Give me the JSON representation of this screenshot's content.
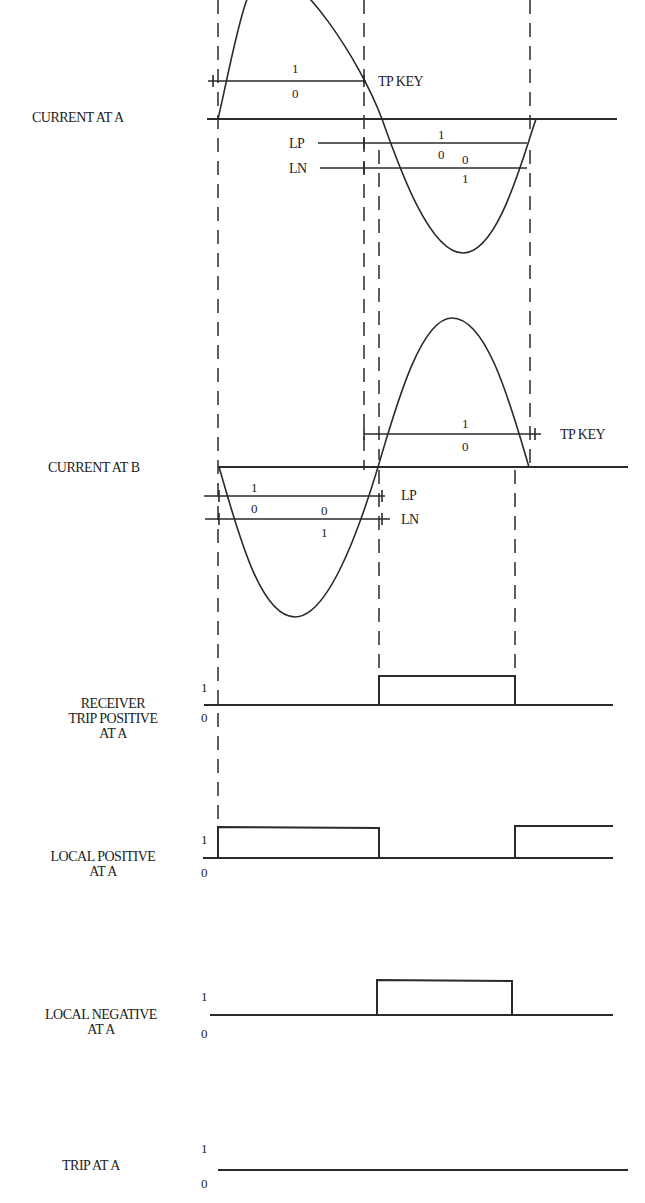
{
  "diagram": {
    "type": "timing-diagram",
    "signals": [
      {
        "id": "current_a",
        "label": "CURRENT AT A",
        "type": "sine",
        "thresholds": [
          {
            "name": "TP KEY",
            "upper": "1",
            "lower": "0"
          },
          {
            "name": "LP",
            "upper": "1",
            "lower": "0"
          },
          {
            "name": "LN",
            "upper": "0",
            "lower": "1"
          }
        ]
      },
      {
        "id": "current_b",
        "label": "CURRENT AT B",
        "type": "sine",
        "thresholds": [
          {
            "name": "TP KEY",
            "upper": "1",
            "lower": "0"
          },
          {
            "name": "LP",
            "upper": "1",
            "lower": "0"
          },
          {
            "name": "LN",
            "upper": "0",
            "lower": "1"
          }
        ]
      },
      {
        "id": "rx_trip_pos",
        "label_lines": [
          "RECEIVER",
          "TRIP POSITIVE",
          "AT A"
        ],
        "type": "digital",
        "high": "1",
        "low": "0",
        "pulses": [
          [
            379,
            515
          ]
        ]
      },
      {
        "id": "local_pos",
        "label_lines": [
          "LOCAL POSITIVE",
          "AT A"
        ],
        "type": "digital",
        "high": "1",
        "low": "0",
        "pulses": [
          [
            218,
            379
          ],
          [
            515,
            613
          ]
        ]
      },
      {
        "id": "local_neg",
        "label_lines": [
          "LOCAL NEGATIVE",
          "AT A"
        ],
        "type": "digital",
        "high": "1",
        "low": "0",
        "pulses": [
          [
            379,
            512
          ]
        ]
      },
      {
        "id": "trip_a",
        "label": "TRIP AT A",
        "type": "digital",
        "high": "1",
        "low": "0",
        "pulses": []
      }
    ]
  },
  "labels": {
    "current_a": "CURRENT AT A",
    "current_b": "CURRENT AT B",
    "tp_key": "TP KEY",
    "lp": "LP",
    "ln": "LN",
    "rx1": "RECEIVER",
    "rx2": "TRIP POSITIVE",
    "rx3": "AT A",
    "lp1": "LOCAL POSITIVE",
    "lp2": "AT A",
    "ln1": "LOCAL NEGATIVE",
    "ln2": "AT A",
    "trip": "TRIP AT A",
    "one": "1",
    "zero": "0"
  }
}
